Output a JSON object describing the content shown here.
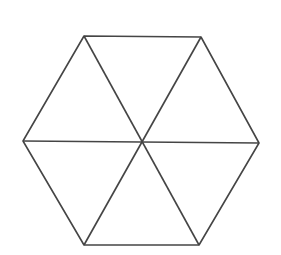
{
  "diagram": {
    "title": "",
    "shape": "regular hexagon divided into six equilateral triangles",
    "stroke_color": "#454545",
    "stroke_width": 1.6,
    "background": "#ffffff",
    "center": [
      143,
      142
    ],
    "vertices": [
      {
        "name": "top-left",
        "x": 84,
        "y": 36
      },
      {
        "name": "top-right",
        "x": 201,
        "y": 37
      },
      {
        "name": "right",
        "x": 259,
        "y": 143
      },
      {
        "name": "bottom-right",
        "x": 199,
        "y": 245
      },
      {
        "name": "bottom-left",
        "x": 84,
        "y": 245
      },
      {
        "name": "left",
        "x": 23,
        "y": 141
      }
    ],
    "triangle_count": 6
  }
}
